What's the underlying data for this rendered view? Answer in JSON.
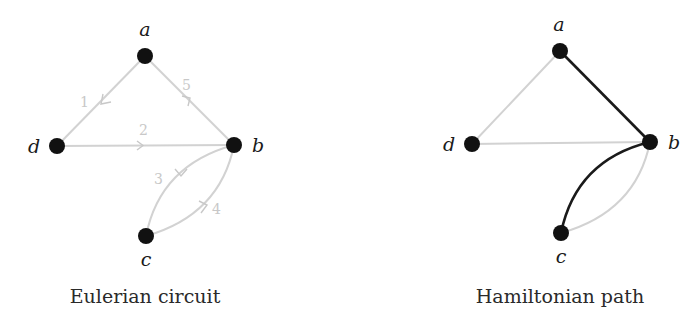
{
  "colors": {
    "node": "#111111",
    "light_edge": "#d2d2d2",
    "dark_edge": "#1a1a1a",
    "edge_label": "#c8c8c8"
  },
  "left": {
    "caption": "Eulerian circuit",
    "nodes": [
      {
        "id": "a",
        "label": "a"
      },
      {
        "id": "b",
        "label": "b"
      },
      {
        "id": "c",
        "label": "c"
      },
      {
        "id": "d",
        "label": "d"
      }
    ],
    "edges": [
      {
        "from": "a",
        "to": "d",
        "order": "1"
      },
      {
        "from": "d",
        "to": "b",
        "order": "2"
      },
      {
        "from": "b",
        "to": "c",
        "order": "3"
      },
      {
        "from": "c",
        "to": "b",
        "order": "4"
      },
      {
        "from": "b",
        "to": "a",
        "order": "5"
      }
    ]
  },
  "right": {
    "caption": "Hamiltonian path",
    "nodes": [
      {
        "id": "a",
        "label": "a"
      },
      {
        "id": "b",
        "label": "b"
      },
      {
        "id": "c",
        "label": "c"
      },
      {
        "id": "d",
        "label": "d"
      }
    ],
    "edges": [
      {
        "from": "a",
        "to": "d",
        "highlighted": false
      },
      {
        "from": "d",
        "to": "b",
        "highlighted": false
      },
      {
        "from": "a",
        "to": "b",
        "highlighted": true
      },
      {
        "from": "b",
        "to": "c",
        "highlighted": true,
        "curve": "upper"
      },
      {
        "from": "c",
        "to": "b",
        "highlighted": false,
        "curve": "lower"
      }
    ]
  }
}
